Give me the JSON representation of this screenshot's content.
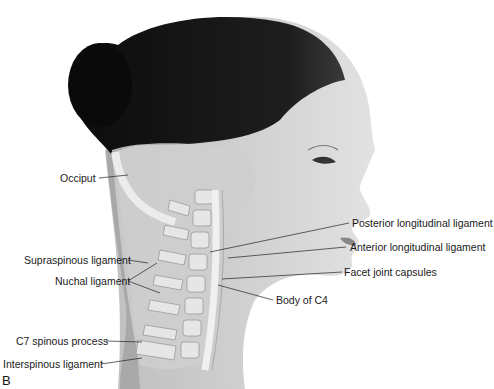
{
  "figure": {
    "panel_letter": "B",
    "colors": {
      "hair": "#111111",
      "skin": "#d9d9d9",
      "bone": "#e8e8e8",
      "overlay": "#c8c8c8",
      "text": "#1a1a1a",
      "leader": "#222222"
    }
  },
  "labels": {
    "occiput": "Occiput",
    "supraspinous": "Supraspinous ligament",
    "nuchal": "Nuchal ligament",
    "c7": "C7 spinous process",
    "interspinous": "Interspinous ligament",
    "posterior_long": "Posterior longitudinal ligament",
    "anterior_long": "Anterior longitudinal ligament",
    "facet": "Facet joint capsules",
    "body_c4": "Body of C4"
  }
}
